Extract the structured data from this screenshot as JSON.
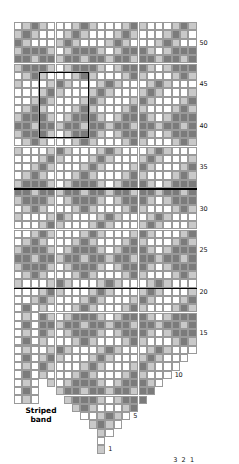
{
  "chart_data": {
    "type": "heatmap",
    "title": "",
    "columns": 22,
    "rows": 52,
    "legend_shades": [
      "white",
      "light",
      "dark"
    ],
    "colors": {
      "white": "#ffffff",
      "light": "#c9c9c9",
      "dark": "#7b7b7b",
      "gridline": "#9a9a9a",
      "outline": "#000000"
    },
    "row_tick_labels": [
      "5",
      "10",
      "15",
      "20",
      "25",
      "30",
      "35",
      "40",
      "45",
      "50"
    ],
    "row_ticks": [
      5,
      10,
      15,
      20,
      25,
      30,
      35,
      40,
      45,
      50
    ],
    "column_tick_labels": [
      "3",
      "2",
      "1"
    ],
    "column_ticks": [
      3,
      2,
      1
    ],
    "repeat_box": {
      "x_start_col": 3,
      "y_start_row": 38,
      "width_cols": 6,
      "height_rows": 8
    },
    "bold_rules": [
      {
        "row": 20,
        "from_col": 0,
        "to_col": 22
      },
      {
        "row": 20,
        "from_col": 14,
        "to_col": 22
      }
    ],
    "xlabel": "",
    "ylabel": "",
    "grid": true,
    "legend_position": "none",
    "cells": [
      "WLDLWWWLDLWWWLDLWWWLDL",
      "LDLWWWLDLWWWLDLWWWLDLW",
      "DLWWWLDLWWWLDLWWWLDLWW",
      "LDDDLWLDDDLWLDDDLWLDDD",
      "DDLDDLDDLDDLDDLDDLDDLD",
      "LDDDLWLDDDLWLDDDLWLDDD",
      "WLDLWWWLDLWWWLDLWWWLDL",
      "LWWWLDLWWWLDLWWWLDLWWW",
      "WWWLDLWWWLDLWWWLDLWWWL",
      "WWLDLWWWLDLWWWLDLWWWLD",
      "WLDLWWWLDLWWWLDLWWWLDL",
      "LDDDLWLDDDLWLDDDLWLDDD",
      "DDLDDLDDLDDLDDLDDLDDLD",
      "LDDDLWLDDDLWLDDDLWLDDD",
      "WLDLWWWLDLWWWLDLWWWLDL",
      "LWWWLDLWWWLDLWWWLDLWWW",
      "WWWLDLWWWLDLWWWLDLWWWL",
      "WWLDLWWWLDLWWWLDLWWWLD",
      "WLDLWWWLDLWWWLDLWWWLDL",
      "LDDDLWLDDDLWLDDDLWLDDD",
      "DDLDDLDDLDDLDDLDDLDDLD",
      "LDDDLWLDDDLWLDDDLWLDDD",
      "WLDLWWWLDLWWWLDLWWWLDL",
      "LWWWLDLWWWLDLWWWLDLWWW",
      "WWWLDLWWWLDLWWWLDLWWWL",
      "WWLDLWWWLDLWWWLDLWWWLD",
      "WLDLWWWLDLWWWLDLWWWLDL",
      "LDDDLWLDDDLWLDDDLWLDDD",
      "DDLDDLDDLDDLDDLDDLDDLD",
      "LDDDLWLDDDLWLDDDLWLDDD",
      "WLDLWWWLDLWWWLDLWWWLDL",
      "LWWWLDLWWWLDLWWWLDLWWW",
      "WWWLDLWWWLDLWWWLDLWWWL",
      "WWLDLWWWLDLWWWLDLWWWLD",
      "WLDLWWWLDLWWWLDLWWWLDL",
      "LDDDLWLDDDLWLDDDLWLDDD",
      "DDLDDLDDLDDLDDLDDLDDLD",
      "LDDDLWLDDDLWLDDDLWLDDD",
      "WLDLWWWLDLWWWLDLWWWLDL",
      "LWWWLDLWWWLDLWWWLDLWWW",
      "WWWLDLWWWLDLWWWLDLWWWL",
      "WWLDLWWWLDLWWWLDLWWWLD",
      "WLDLWWWLDLWWWLDLWWWLDL",
      "LDDDLWLDDDLWLDDDLWLDDD",
      "DDLDDLDDLDDLDDLDDLDDLD",
      "LDDDLWLDDDLWLDDDLWLDDD",
      "WLDLWWWLDLWWWLDLWWWLDL",
      "LWWWLDLWWWLDLWWWLDLWWW",
      "WWWLDLWWWLDLWWWLDLWWWL",
      "WWLDLWWWLDLWWWLDLWWWLD",
      "WLDLWWWLDLWWWLDLWWWLDL",
      "LDDDLWLDDDLWLDDDLWLDDD"
    ],
    "decrease_shape": {
      "description": "lower edge narrows symmetrically to a point at row 1, 2 stitches lost per row on each side below row 13",
      "full_width_above_row": 13,
      "apex_row": 1
    }
  },
  "striped_band": {
    "caption_line1": "Striped",
    "caption_line2": "band",
    "columns": 3,
    "rows": 12,
    "cells": [
      "WDW",
      "WLW",
      "WDW",
      "WLW",
      "WDW",
      "WLW",
      "WDW",
      "WLW",
      "WDW",
      "WLW",
      "WDW",
      "WLW"
    ]
  }
}
